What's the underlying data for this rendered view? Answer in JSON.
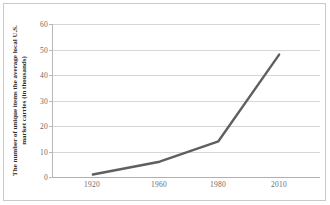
{
  "chart_data": {
    "type": "line",
    "title": "",
    "subtitle": "",
    "xlabel": "",
    "ylabel": "The number of unique items the average local U.S. market carries (in thousands)",
    "x": [
      1920,
      1960,
      1980,
      2010
    ],
    "values": [
      1,
      6,
      14,
      48
    ],
    "series": [
      {
        "name": "Unique items carried",
        "values": [
          1,
          6,
          14,
          48
        ]
      }
    ],
    "categories": [
      "1920",
      "1960",
      "1980",
      "2010"
    ],
    "xtick_labels": [
      "1920",
      "1960",
      "1980",
      "2010"
    ],
    "ytick_labels": [
      "0",
      "10",
      "20",
      "30",
      "40",
      "50",
      "60"
    ],
    "ytick_values": [
      0,
      10,
      20,
      30,
      40,
      50,
      60
    ],
    "ylim": [
      0,
      60
    ],
    "grid": "horizontal",
    "legend": "none",
    "annotations": [],
    "colors": {
      "line": "#5f5f5f",
      "gridline": "#d6d6d6",
      "axis": "#b0b0b0",
      "tick_text": "#6a6a6a",
      "axis_title": "#2b2b2b",
      "plot_background": "#ffffff",
      "figure_border": "#c9c9c9"
    }
  }
}
